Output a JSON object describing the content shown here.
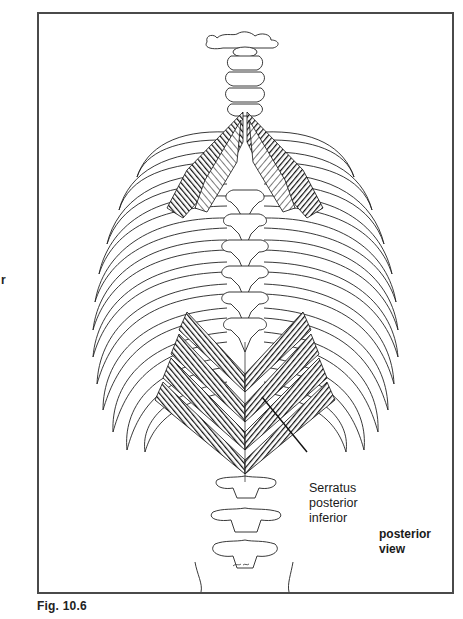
{
  "figure": {
    "caption": "Fig. 10.6",
    "view_label": [
      "posterior",
      "view"
    ],
    "muscle_label": [
      "Serratus",
      "posterior",
      "inferior"
    ],
    "margin_fragment": "r",
    "illustration": {
      "subject": "posterior thorax with spine and ribs",
      "structures": [
        "atlas",
        "cervical vertebrae",
        "thoracic vertebrae",
        "ribs",
        "lumbar vertebrae",
        "sacrum",
        "serratus posterior superior",
        "serratus posterior inferior"
      ]
    },
    "colors": {
      "frame": "#4a4a4a",
      "ink": "#1a1a1a",
      "paper": "#ffffff"
    }
  }
}
